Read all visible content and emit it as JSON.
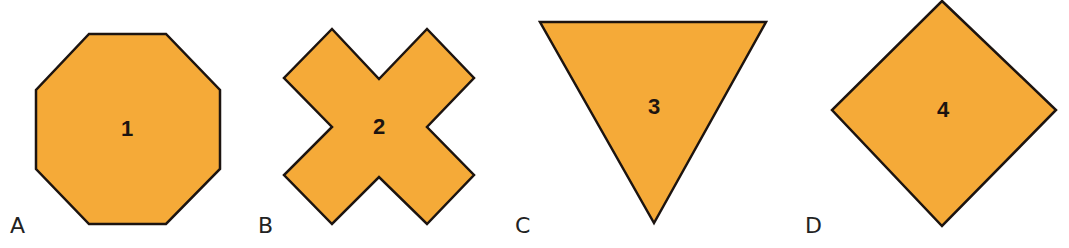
{
  "figure": {
    "fill_color": "#f5aa38",
    "stroke_color": "#1c1410",
    "options": [
      {
        "letter": "A",
        "number": "1",
        "shape": "octagon"
      },
      {
        "letter": "B",
        "number": "2",
        "shape": "cross"
      },
      {
        "letter": "C",
        "number": "3",
        "shape": "inverted-triangle"
      },
      {
        "letter": "D",
        "number": "4",
        "shape": "diamond"
      }
    ]
  }
}
